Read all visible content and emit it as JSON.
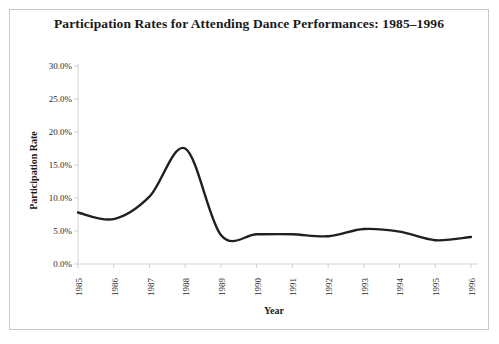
{
  "figure": {
    "background_color": "#ffffff",
    "border_color": "#c8c8c8",
    "title": "Participation Rates for Attending Dance Performances: 1985–1996"
  },
  "axes": {
    "y_label": "Participation Rate",
    "x_label": "Year",
    "axis_line_color": "#d0d0d0",
    "tick_color": "#d0d0d0",
    "y_tick_labels": [
      "30.0%",
      "25.0%",
      "20.0%",
      "15.0%",
      "10.0%",
      "5.0%",
      "0.0%"
    ],
    "x_tick_labels": [
      "1985",
      "1986",
      "1987",
      "1988",
      "1989",
      "1990",
      "1991",
      "1992",
      "1993",
      "1994",
      "1995",
      "1996"
    ]
  },
  "series_style": {
    "line_color": "#231f20",
    "line_width": 2.4
  },
  "chart_data": {
    "type": "line",
    "title": "Participation Rates for Attending Dance Performances: 1985–1996",
    "xlabel": "Year",
    "ylabel": "Participation Rate",
    "x": [
      1985,
      1986,
      1987,
      1988,
      1989,
      1990,
      1991,
      1992,
      1993,
      1994,
      1995,
      1996
    ],
    "categories": [
      "1985",
      "1986",
      "1987",
      "1988",
      "1989",
      "1990",
      "1991",
      "1992",
      "1993",
      "1994",
      "1995",
      "1996"
    ],
    "values": [
      7.8,
      6.8,
      10.2,
      17.5,
      4.4,
      4.5,
      4.5,
      4.2,
      5.3,
      4.9,
      3.6,
      4.1
    ],
    "units": "percent",
    "ylim": [
      0,
      30
    ],
    "y_ticks": [
      0,
      5,
      10,
      15,
      20,
      25,
      30
    ],
    "y_tick_labels": [
      "0.0%",
      "5.0%",
      "10.0%",
      "15.0%",
      "20.0%",
      "25.0%",
      "30.0%"
    ],
    "xlim": [
      1985,
      1996
    ],
    "grid": false,
    "legend": false,
    "smoothing": "spline",
    "series": [
      {
        "name": "Participation Rate",
        "values": [
          7.8,
          6.8,
          10.2,
          17.5,
          4.4,
          4.5,
          4.5,
          4.2,
          5.3,
          4.9,
          3.6,
          4.1
        ]
      }
    ]
  }
}
